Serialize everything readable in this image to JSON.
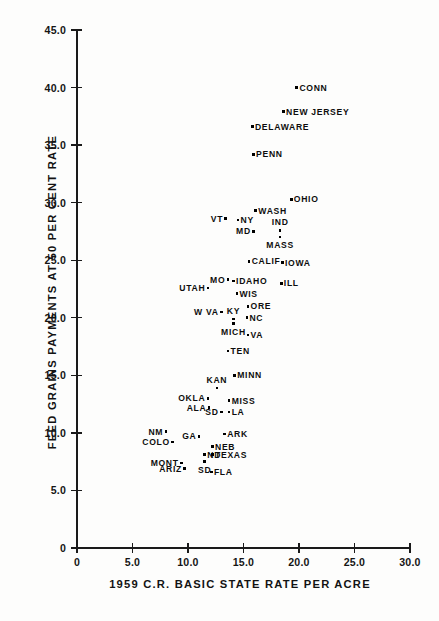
{
  "chart_data": {
    "type": "scatter",
    "title": "",
    "xlabel": "1959  C.R.  BASIC  STATE  RATE  PER  ACRE",
    "ylabel": "FEED  GRAINS  PAYMENTS  AT  50  PER CENT  RATE",
    "xlim": [
      0,
      30
    ],
    "ylim": [
      0,
      45
    ],
    "grid": false,
    "legend": "none",
    "xticks": [
      "0",
      "5.0",
      "10.0",
      "15.0",
      "20.0",
      "25.0",
      "30.0"
    ],
    "xtick_values": [
      0,
      5,
      10,
      15,
      20,
      25,
      30
    ],
    "yticks": [
      "0",
      "5.0",
      "10.0",
      "15.0",
      "20.0",
      "25.0",
      "30.0",
      "35.0",
      "40.0",
      "45.0"
    ],
    "ytick_values": [
      0,
      5,
      10,
      15,
      20,
      25,
      30,
      35,
      40,
      45
    ],
    "point_labels": [
      "CONN",
      "NEW JERSEY",
      "DELAWARE",
      "PENN",
      "OHIO",
      "WASH",
      "VT",
      "NY",
      "IND",
      "MD",
      "MASS",
      "CALIF",
      "IOWA",
      "MO",
      "IDAHO",
      "ILL",
      "UTAH",
      "WIS",
      "ORE",
      "W VA",
      "KY",
      "NC",
      "MICH",
      "VA",
      "TEN",
      "MINN",
      "KAN",
      "OKLA",
      "MISS",
      "ALA",
      "SD",
      "LA",
      "NM",
      "GA",
      "ARK",
      "COLO",
      "NEB",
      "ND",
      "TEXAS",
      "MONT",
      "SD",
      "ARIZ",
      "FLA"
    ],
    "points": [
      {
        "label": "CONN",
        "x": 19.8,
        "y": 40.0,
        "lab": "right"
      },
      {
        "label": "NEW JERSEY",
        "x": 18.6,
        "y": 37.9,
        "lab": "right"
      },
      {
        "label": "DELAWARE",
        "x": 15.8,
        "y": 36.6,
        "lab": "right"
      },
      {
        "label": "PENN",
        "x": 15.9,
        "y": 34.2,
        "lab": "right"
      },
      {
        "label": "OHIO",
        "x": 19.3,
        "y": 30.3,
        "lab": "right"
      },
      {
        "label": "WASH",
        "x": 16.1,
        "y": 29.3,
        "lab": "right"
      },
      {
        "label": "VT",
        "x": 13.4,
        "y": 28.6,
        "lab": "left"
      },
      {
        "label": "NY",
        "x": 14.5,
        "y": 28.5,
        "lab": "right"
      },
      {
        "label": "IND",
        "x": 18.3,
        "y": 27.6,
        "lab": "above"
      },
      {
        "label": "MD",
        "x": 15.9,
        "y": 27.5,
        "lab": "left"
      },
      {
        "label": "MASS",
        "x": 18.3,
        "y": 27.0,
        "lab": "below"
      },
      {
        "label": "CALIF",
        "x": 15.5,
        "y": 24.9,
        "lab": "right"
      },
      {
        "label": "IOWA",
        "x": 18.5,
        "y": 24.8,
        "lab": "right"
      },
      {
        "label": "MO",
        "x": 13.6,
        "y": 23.3,
        "lab": "left"
      },
      {
        "label": "IDAHO",
        "x": 14.1,
        "y": 23.2,
        "lab": "right"
      },
      {
        "label": "ILL",
        "x": 18.4,
        "y": 23.0,
        "lab": "right"
      },
      {
        "label": "UTAH",
        "x": 11.8,
        "y": 22.6,
        "lab": "left"
      },
      {
        "label": "WIS",
        "x": 14.4,
        "y": 22.1,
        "lab": "right"
      },
      {
        "label": "ORE",
        "x": 15.4,
        "y": 21.0,
        "lab": "right"
      },
      {
        "label": "W VA",
        "x": 13.0,
        "y": 20.5,
        "lab": "left"
      },
      {
        "label": "KY",
        "x": 14.1,
        "y": 19.9,
        "lab": "above"
      },
      {
        "label": "NC",
        "x": 15.3,
        "y": 20.0,
        "lab": "right"
      },
      {
        "label": "MICH",
        "x": 14.1,
        "y": 19.5,
        "lab": "below"
      },
      {
        "label": "VA",
        "x": 15.4,
        "y": 18.5,
        "lab": "right"
      },
      {
        "label": "TEN",
        "x": 13.6,
        "y": 17.1,
        "lab": "right"
      },
      {
        "label": "MINN",
        "x": 14.2,
        "y": 15.0,
        "lab": "right"
      },
      {
        "label": "KAN",
        "x": 12.6,
        "y": 13.9,
        "lab": "above"
      },
      {
        "label": "OKLA",
        "x": 11.8,
        "y": 13.0,
        "lab": "left"
      },
      {
        "label": "MISS",
        "x": 13.7,
        "y": 12.8,
        "lab": "right"
      },
      {
        "label": "ALA",
        "x": 11.9,
        "y": 12.2,
        "lab": "left"
      },
      {
        "label": "SD",
        "x": 13.0,
        "y": 11.8,
        "lab": "left"
      },
      {
        "label": "LA",
        "x": 13.7,
        "y": 11.8,
        "lab": "right"
      },
      {
        "label": "NM",
        "x": 8.0,
        "y": 10.1,
        "lab": "left"
      },
      {
        "label": "GA",
        "x": 11.0,
        "y": 9.7,
        "lab": "left"
      },
      {
        "label": "ARK",
        "x": 13.3,
        "y": 9.9,
        "lab": "right"
      },
      {
        "label": "COLO",
        "x": 8.6,
        "y": 9.2,
        "lab": "left"
      },
      {
        "label": "NEB",
        "x": 12.2,
        "y": 8.8,
        "lab": "right"
      },
      {
        "label": "ND",
        "x": 11.5,
        "y": 8.1,
        "lab": "right"
      },
      {
        "label": "TEXAS",
        "x": 12.2,
        "y": 8.1,
        "lab": "right"
      },
      {
        "label": "MONT",
        "x": 9.4,
        "y": 7.4,
        "lab": "left"
      },
      {
        "label": "SD",
        "x": 11.5,
        "y": 7.5,
        "lab": "below"
      },
      {
        "label": "ARIZ",
        "x": 9.7,
        "y": 6.9,
        "lab": "left"
      },
      {
        "label": "FLA",
        "x": 12.1,
        "y": 6.6,
        "lab": "right"
      }
    ]
  }
}
